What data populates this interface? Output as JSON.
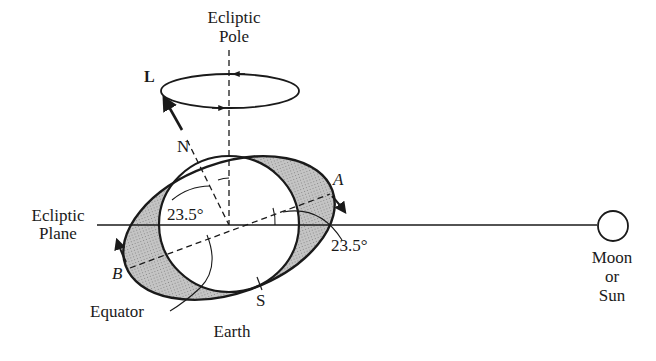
{
  "diagram": {
    "labels": {
      "ecliptic_pole_line1": "Ecliptic",
      "ecliptic_pole_line2": "Pole",
      "angular_momentum": "L",
      "north": "N",
      "south": "S",
      "point_a": "A",
      "point_b": "B",
      "angle_upper": "23.5°",
      "angle_right": "23.5°",
      "ecliptic_plane_line1": "Ecliptic",
      "ecliptic_plane_line2": "Plane",
      "equator": "Equator",
      "earth": "Earth",
      "body_line1": "Moon",
      "body_line2": "or",
      "body_line3": "Sun"
    },
    "colors": {
      "ink": "#1a1a1a",
      "bulge_fill": "#b8b8b8",
      "background": "#ffffff"
    }
  }
}
